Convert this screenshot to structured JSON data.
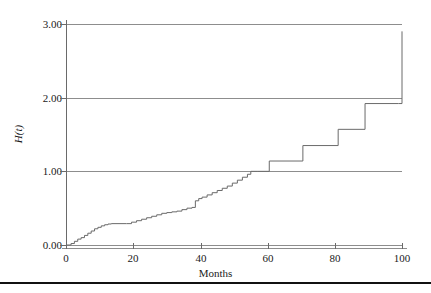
{
  "figure": {
    "background_color": "#ffffff",
    "line_color": "#6a6a6a",
    "grid_color": "#8d8d8d",
    "rule_color": "#111111"
  },
  "axes": {
    "y_title": "H(t)",
    "x_title": "Months",
    "y_ticks": [
      "0.00",
      "1.00",
      "2.00",
      "3.00"
    ],
    "x_ticks": [
      "0",
      "20",
      "40",
      "60",
      "80",
      "100"
    ]
  },
  "chart_data": {
    "type": "line",
    "title": "",
    "subtitle": "",
    "xlabel": "Months",
    "ylabel": "H(t)",
    "xlim": [
      0,
      100
    ],
    "ylim": [
      0.0,
      3.0
    ],
    "xticks": [
      0,
      20,
      40,
      60,
      80,
      100
    ],
    "yticks": [
      0.0,
      1.0,
      2.0,
      3.0
    ],
    "grid": true,
    "grid_axis": "y",
    "legend": false,
    "legend_position": "none",
    "interpolation": "step-post",
    "series": [
      {
        "name": "H(t)",
        "description": "Nelson-Aalen cumulative hazard step function",
        "x": [
          0,
          1.5,
          2.5,
          3.5,
          4.5,
          5.5,
          6.5,
          7.5,
          8.5,
          9.5,
          10.5,
          11.5,
          12.5,
          13.5,
          18.0,
          19.5,
          21.0,
          22.5,
          24.0,
          25.5,
          27.0,
          28.5,
          30.0,
          31.5,
          33.0,
          34.5,
          36.0,
          37.5,
          38.5,
          39.5,
          40.5,
          42.0,
          43.5,
          45.0,
          46.5,
          48.0,
          49.5,
          51.0,
          52.5,
          54.0,
          55.0,
          57.0,
          60.5,
          70.5,
          81.0,
          89.0,
          99.0,
          100.0
        ],
        "y": [
          0.0,
          0.02,
          0.05,
          0.08,
          0.1,
          0.13,
          0.16,
          0.19,
          0.22,
          0.24,
          0.26,
          0.275,
          0.285,
          0.29,
          0.29,
          0.31,
          0.33,
          0.35,
          0.37,
          0.39,
          0.41,
          0.43,
          0.44,
          0.45,
          0.46,
          0.48,
          0.5,
          0.51,
          0.6,
          0.63,
          0.65,
          0.68,
          0.71,
          0.74,
          0.77,
          0.8,
          0.84,
          0.88,
          0.92,
          0.96,
          1.0,
          1.0,
          1.14,
          1.35,
          1.57,
          1.92,
          1.92,
          2.9
        ],
        "final_jump": {
          "x": 99.0,
          "from": 1.92,
          "to": 2.9
        }
      }
    ]
  }
}
